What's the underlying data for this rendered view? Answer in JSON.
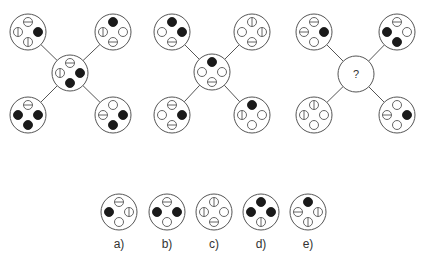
{
  "puzzle": {
    "question_mark": "?",
    "colors": {
      "stroke": "#555555",
      "fill": "#1a1a1a",
      "background": "#ffffff"
    },
    "symbol_legend": {
      "filled": "solid black dot",
      "empty": "hollow dot",
      "hline": "hollow dot with horizontal line",
      "vline": "hollow dot with vertical line"
    },
    "figures": [
      {
        "name": "figure-1",
        "center": [
          70,
          73
        ],
        "nodes": [
          {
            "pos": "top-left",
            "c": [
              28,
              32
            ],
            "dots": {
              "top": "hline",
              "left": "vline",
              "right": "filled",
              "bottom": "vline"
            }
          },
          {
            "pos": "top-right",
            "c": [
              113,
              32
            ],
            "dots": {
              "top": "filled",
              "left": "vline",
              "right": "empty",
              "bottom": "hline"
            }
          },
          {
            "pos": "center",
            "c": [
              70,
              73
            ],
            "dots": {
              "top": "hline",
              "left": "vline",
              "right": "filled",
              "bottom": "filled"
            }
          },
          {
            "pos": "bottom-left",
            "c": [
              28,
              115
            ],
            "dots": {
              "top": "hline",
              "left": "filled",
              "right": "filled",
              "bottom": "filled"
            }
          },
          {
            "pos": "bottom-right",
            "c": [
              113,
              115
            ],
            "dots": {
              "top": "empty",
              "left": "hline",
              "right": "filled",
              "bottom": "filled"
            }
          }
        ]
      },
      {
        "name": "figure-2",
        "center": [
          212,
          72
        ],
        "nodes": [
          {
            "pos": "top-left",
            "c": [
              172,
              32
            ],
            "dots": {
              "top": "filled",
              "left": "empty",
              "right": "filled",
              "bottom": "hline"
            }
          },
          {
            "pos": "top-right",
            "c": [
              252,
              32
            ],
            "dots": {
              "top": "vline",
              "left": "empty",
              "right": "vline",
              "bottom": "hline"
            }
          },
          {
            "pos": "center",
            "c": [
              212,
              72
            ],
            "dots": {
              "top": "filled",
              "left": "empty",
              "right": "empty",
              "bottom": "hline"
            }
          },
          {
            "pos": "bottom-left",
            "c": [
              172,
              115
            ],
            "dots": {
              "top": "hline",
              "left": "empty",
              "right": "filled",
              "bottom": "hline"
            }
          },
          {
            "pos": "bottom-right",
            "c": [
              252,
              115
            ],
            "dots": {
              "top": "filled",
              "left": "vline",
              "right": "empty",
              "bottom": "empty"
            }
          }
        ]
      },
      {
        "name": "figure-3",
        "center": [
          356,
          74
        ],
        "nodes": [
          {
            "pos": "top-left",
            "c": [
              314,
              32
            ],
            "dots": {
              "top": "hline",
              "left": "hline",
              "right": "filled",
              "bottom": "empty"
            }
          },
          {
            "pos": "top-right",
            "c": [
              397,
              32
            ],
            "dots": {
              "top": "hline",
              "left": "filled",
              "right": "empty",
              "bottom": "filled"
            }
          },
          {
            "pos": "center",
            "c": [
              356,
              74
            ],
            "unknown": true
          },
          {
            "pos": "bottom-left",
            "c": [
              314,
              115
            ],
            "dots": {
              "top": "vline",
              "left": "vline",
              "right": "empty",
              "bottom": "empty"
            }
          },
          {
            "pos": "bottom-right",
            "c": [
              397,
              115
            ],
            "dots": {
              "top": "empty",
              "left": "hline",
              "right": "filled",
              "bottom": "empty"
            }
          }
        ]
      }
    ],
    "options": [
      {
        "label": "a)",
        "c": [
          119,
          212
        ],
        "dots": {
          "top": "hline",
          "left": "filled",
          "right": "vline",
          "bottom": "empty"
        }
      },
      {
        "label": "b)",
        "c": [
          167,
          212
        ],
        "dots": {
          "top": "hline",
          "left": "filled",
          "right": "filled",
          "bottom": "empty"
        }
      },
      {
        "label": "c)",
        "c": [
          214,
          212
        ],
        "dots": {
          "top": "vline",
          "left": "vline",
          "right": "empty",
          "bottom": "hline"
        }
      },
      {
        "label": "d)",
        "c": [
          261,
          212
        ],
        "dots": {
          "top": "filled",
          "left": "filled",
          "right": "filled",
          "bottom": "vline"
        }
      },
      {
        "label": "e)",
        "c": [
          308,
          212
        ],
        "dots": {
          "top": "filled",
          "left": "hline",
          "right": "vline",
          "bottom": "vline"
        }
      }
    ]
  }
}
